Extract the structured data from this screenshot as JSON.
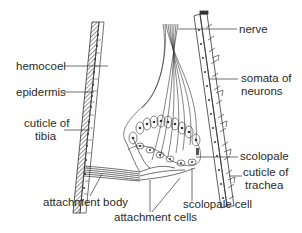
{
  "diagram": {
    "labels": {
      "nerve": "nerve",
      "somata_line1": "somata of",
      "somata_line2": "neurons",
      "scolopale": "scolopale",
      "trachea_line1": "cuticle of",
      "trachea_line2": "trachea",
      "hemocoel": "hemocoel",
      "epidermis": "epidermis",
      "tibia_line1": "cuticle of",
      "tibia_line2": "tibia",
      "attachment_body": "attachment body",
      "attachment_cells": "attachment cells",
      "scolopale_cell": "scolopale cell"
    },
    "colors": {
      "ink": "#2a2a2a",
      "background": "#ffffff"
    }
  }
}
